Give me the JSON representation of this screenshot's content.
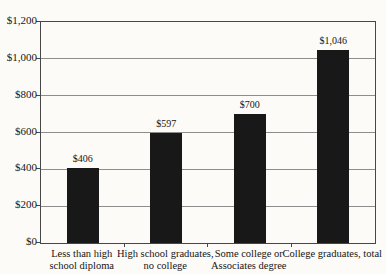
{
  "chart_data": {
    "type": "bar",
    "title": "",
    "xlabel": "",
    "ylabel": "",
    "categories": [
      "Less than high school diploma",
      "High school graduates, no college",
      "Some college or Associates degree",
      "College graduates, total"
    ],
    "category_lines": [
      [
        "Less than high",
        "school diploma"
      ],
      [
        "High school graduates,",
        "no college"
      ],
      [
        "Some college or",
        "Associates degree"
      ],
      [
        "College graduates, total"
      ]
    ],
    "values": [
      406,
      597,
      700,
      1046
    ],
    "value_labels": [
      "$406",
      "$597",
      "$700",
      "$1,046"
    ],
    "y_ticks": [
      0,
      200,
      400,
      600,
      800,
      1000,
      1200
    ],
    "y_tick_labels": [
      "$0",
      "$200",
      "$400",
      "$600",
      "$800",
      "$1,000",
      "$1,200"
    ],
    "ylim": [
      0,
      1200
    ],
    "grid": true,
    "legend": "none",
    "colors": {
      "bar": "#181818",
      "axis": "#474747",
      "gridline": "#8d8d8d",
      "background": "#fcfbf8",
      "text": "#151515"
    }
  }
}
